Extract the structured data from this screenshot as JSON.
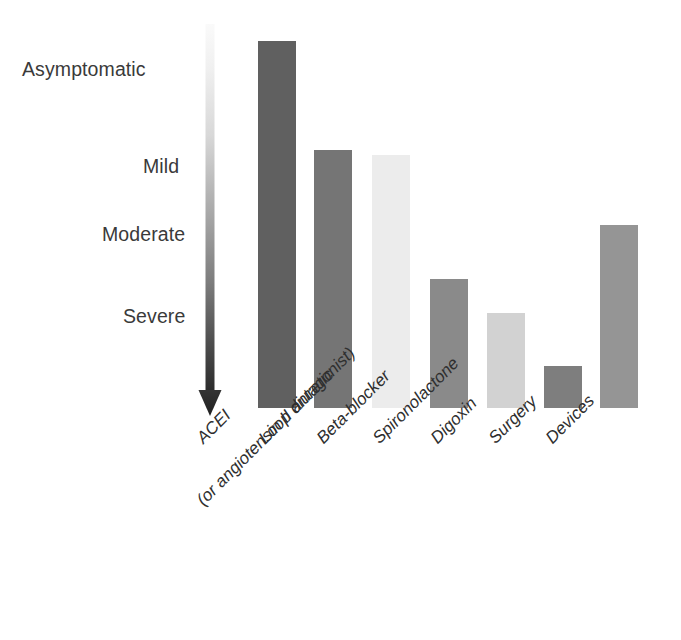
{
  "chart_data": {
    "type": "bar",
    "title": "",
    "subtitle": "",
    "xlabel": "",
    "ylabel": "",
    "orientation": "vertical",
    "grid": false,
    "legend": false,
    "axis_note": "Bar height indicates the stage of heart failure severity at which each therapy is introduced; taller bar = used from earlier/milder disease.",
    "severity_axis": {
      "direction": "top = asymptomatic, bottom = severe",
      "ticks": [
        {
          "label": "Asymptomatic",
          "y_px": 70
        },
        {
          "label": "Mild",
          "y_px": 167
        },
        {
          "label": "Moderate",
          "y_px": 235
        },
        {
          "label": "Severe",
          "y_px": 317
        }
      ]
    },
    "categories": [
      "ACEI",
      "Loop diuretic",
      "Beta-blocker",
      "Spironolactone",
      "Digoxin",
      "Surgery",
      "Devices"
    ],
    "category_sublabels": [
      "(or angiotensin II antagonist)",
      "",
      "",
      "",
      "",
      "",
      ""
    ],
    "values": [
      367,
      258,
      253,
      129,
      95,
      42,
      183
    ],
    "value_units": "px bar height above baseline",
    "severity_onset": [
      "Asymptomatic",
      "Mild",
      "Mild",
      "Moderate-Severe",
      "Severe",
      "Severe",
      "Moderate"
    ],
    "ylim": [
      0,
      380
    ],
    "bar_colors": [
      "#606060",
      "#757575",
      "#ececec",
      "#8a8a8a",
      "#d2d2d2",
      "#7e7e7e",
      "#959595"
    ],
    "bars": [
      {
        "category": "ACEI",
        "value": 367,
        "color": "#606060",
        "x_px": 258,
        "width_px": 38,
        "top_px": 41
      },
      {
        "category": "Loop diuretic",
        "value": 258,
        "color": "#757575",
        "x_px": 314,
        "width_px": 38,
        "top_px": 150
      },
      {
        "category": "Beta-blocker",
        "value": 253,
        "color": "#ececec",
        "x_px": 372,
        "width_px": 38,
        "top_px": 155
      },
      {
        "category": "Spironolactone",
        "value": 129,
        "color": "#8a8a8a",
        "x_px": 430,
        "width_px": 38,
        "top_px": 279
      },
      {
        "category": "Digoxin",
        "value": 95,
        "color": "#d2d2d2",
        "x_px": 487,
        "width_px": 38,
        "top_px": 313
      },
      {
        "category": "Surgery",
        "value": 42,
        "color": "#7e7e7e",
        "x_px": 544,
        "width_px": 38,
        "top_px": 366
      },
      {
        "category": "Devices",
        "value": 183,
        "color": "#959595",
        "x_px": 600,
        "width_px": 38,
        "top_px": 225
      }
    ],
    "baseline_px": 408
  },
  "arrow": {
    "name": "severity-gradient-arrow",
    "description": "Vertical arrow pointing down, shaft shaded from near-white at top to near-black at the tip",
    "gradient_from": "#f5f5f5",
    "gradient_to": "#2a2a2a"
  },
  "caption": {
    "cut_off_text": ""
  }
}
